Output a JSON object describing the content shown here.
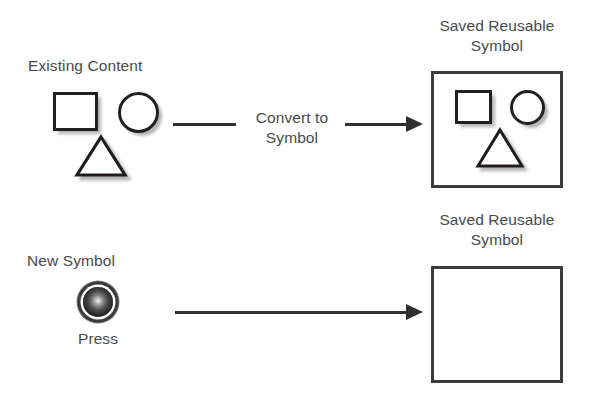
{
  "diagram": {
    "title_context": "Convert to Symbol workflow",
    "rows": [
      {
        "id": "row-existing-content",
        "source_label": "Existing Content",
        "action_label": "Convert to\nSymbol",
        "result_label": "Saved Reusable\nSymbol",
        "source_shapes": [
          "square",
          "circle",
          "triangle"
        ],
        "result_shapes": [
          "square",
          "circle",
          "triangle"
        ]
      },
      {
        "id": "row-new-symbol",
        "source_label": "New Symbol",
        "action_label": "",
        "button_caption": "Press",
        "result_label": "Saved Reusable\nSymbol",
        "source_shapes": [
          "glossy-button"
        ],
        "result_shapes": [
          "glossy-button"
        ]
      }
    ]
  },
  "labels": {
    "existing_content": "Existing Content",
    "convert_to_symbol": "Convert to\nSymbol",
    "saved_reusable_symbol_top": "Saved Reusable\nSymbol",
    "new_symbol": "New Symbol",
    "press": "Press",
    "saved_reusable_symbol_bottom": "Saved Reusable\nSymbol"
  },
  "colors": {
    "background": "#ffffff",
    "text": "#4a4a4a",
    "shape_stroke": "#231f20",
    "box_border": "#3b3b3b",
    "arrow": "#2f2f2f",
    "button_dark": "#141414",
    "button_highlight": "#f2f2f2"
  },
  "icons": {
    "square": "square-icon",
    "circle": "circle-icon",
    "triangle": "triangle-icon",
    "glossy_button": "glossy-button-icon",
    "arrow": "arrow-right-icon"
  }
}
